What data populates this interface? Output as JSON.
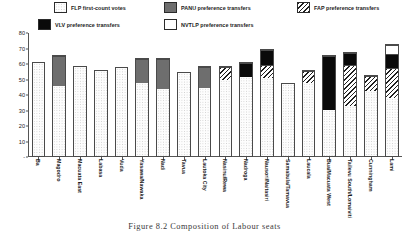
{
  "figure": {
    "caption": "Figure 8.2  Composition of Labour seats",
    "ylabel": "Percentage of valid ballots"
  },
  "legend": {
    "items": [
      {
        "label": "FLP first-count votes",
        "key": "flp",
        "swatch": "dotted-light-swatch"
      },
      {
        "label": "PANU preference transfers",
        "key": "panu",
        "swatch": "solid-gray-swatch"
      },
      {
        "label": "FAP preference transfers",
        "key": "fap",
        "swatch": "diagonal-hatch-swatch"
      },
      {
        "label": "VLV preference transfers",
        "key": "vlv",
        "swatch": "solid-black-swatch"
      },
      {
        "label": "NVTLP preference transfers",
        "key": "nvtlp",
        "swatch": "plain-white-swatch"
      }
    ]
  },
  "colors": {
    "flp": "#fdfdfd",
    "panu": "#6e6e6e",
    "fap": "#ffffff",
    "vlv": "#0a0a0a",
    "nvtlp": "#ffffff",
    "axis": "#555555",
    "text": "#1a1a1a"
  },
  "chart_data": {
    "type": "bar",
    "title": "",
    "xlabel": "",
    "ylabel": "Percentage of valid ballots",
    "ylim": [
      0,
      80
    ],
    "yticks": [
      0,
      10,
      20,
      30,
      40,
      50,
      60,
      70,
      80
    ],
    "ytick_labels": [
      "-",
      "10",
      "20",
      "30",
      "40",
      "50",
      "60",
      "70",
      "80"
    ],
    "grid": false,
    "stacked": true,
    "legend_position": "above-plot",
    "categories": [
      "Ba",
      "Magodro",
      "Macuata East",
      "Labasa",
      "Vuda",
      "Yasawa/Nawaka",
      "Nadi",
      "Tavua",
      "Lautoka City",
      "Nasinu/Rewa",
      "Nadroga",
      "Nausori/Naitasiri",
      "Samabula/Tamavua",
      "Laucala",
      "Bua/Macuata West",
      "Tailevu South/Lomaiviti",
      "Cunningham",
      "Lami"
    ],
    "series": [
      {
        "name": "FLP first-count votes",
        "key": "flp",
        "values": [
          61,
          46,
          59,
          56,
          58,
          48,
          44,
          55,
          45,
          50,
          52,
          51,
          48,
          48,
          30,
          33,
          43,
          38
        ]
      },
      {
        "name": "PANU preference transfers",
        "key": "panu",
        "values": [
          0,
          20,
          0,
          0,
          0,
          16,
          20,
          0,
          14,
          0,
          0,
          0,
          0,
          0,
          0,
          0,
          0,
          0
        ]
      },
      {
        "name": "FAP preference transfers",
        "key": "fap",
        "values": [
          0,
          0,
          0,
          0,
          0,
          0,
          0,
          0,
          0,
          9,
          0,
          9,
          0,
          8,
          0,
          27,
          10,
          20
        ]
      },
      {
        "name": "VLV preference transfers",
        "key": "vlv",
        "values": [
          0,
          0,
          0,
          0,
          0,
          0,
          0,
          0,
          0,
          0,
          9,
          10,
          0,
          0,
          36,
          8,
          0,
          9
        ]
      },
      {
        "name": "NVTLP preference transfers",
        "key": "nvtlp",
        "values": [
          0,
          0,
          0,
          0,
          0,
          0,
          0,
          0,
          0,
          0,
          0,
          0,
          0,
          0,
          0,
          0,
          0,
          6
        ]
      }
    ]
  }
}
